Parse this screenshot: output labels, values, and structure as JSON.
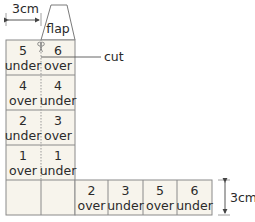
{
  "dimensions": {
    "width_label": "3cm",
    "height_label": "3cm"
  },
  "flap": {
    "label": "flap"
  },
  "cut": {
    "label": "cut"
  },
  "colors": {
    "cell_fill": "#f7f4ec",
    "stroke": "#8a8a8a",
    "text": "#2a2a2a"
  },
  "column_cells": [
    {
      "left_num": "5",
      "left_word": "under",
      "right_num": "6",
      "right_word": "over"
    },
    {
      "left_num": "4",
      "left_word": "over",
      "right_num": "4",
      "right_word": "under"
    },
    {
      "left_num": "2",
      "left_word": "under",
      "right_num": "3",
      "right_word": "over"
    },
    {
      "left_num": "1",
      "left_word": "over",
      "right_num": "1",
      "right_word": "under"
    }
  ],
  "bottom_cells": [
    {
      "num": "2",
      "word": "over"
    },
    {
      "num": "3",
      "word": "under"
    },
    {
      "num": "5",
      "word": "over"
    },
    {
      "num": "6",
      "word": "under"
    }
  ]
}
